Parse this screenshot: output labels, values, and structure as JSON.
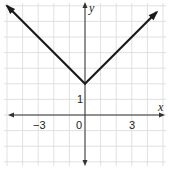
{
  "chart_data": {
    "type": "line",
    "title": "",
    "xlabel": "x",
    "ylabel": "y",
    "function": "y = |x| + 2",
    "xlim": [
      -5,
      5
    ],
    "ylim": [
      -3,
      7
    ],
    "grid": true,
    "x_tick_labels": [
      {
        "value": -3,
        "label": "−3"
      },
      {
        "value": 0,
        "label": "0"
      },
      {
        "value": 3,
        "label": "3"
      }
    ],
    "y_tick_labels": [
      {
        "value": 1,
        "label": "1"
      }
    ],
    "series": [
      {
        "name": "y = |x| + 2",
        "points": [
          [
            -5,
            7
          ],
          [
            0,
            2
          ],
          [
            4.6,
            6.6
          ]
        ],
        "arrows": "both-ends",
        "color": "#1a1a1a"
      }
    ]
  },
  "labels": {
    "x_axis": "x",
    "y_axis": "y",
    "tick_neg3": "−3",
    "tick_0": "0",
    "tick_3": "3",
    "tick_y1": "1"
  }
}
